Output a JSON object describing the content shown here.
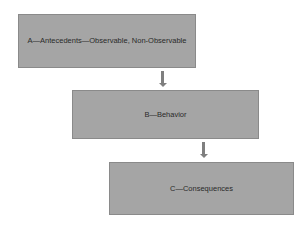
{
  "diagram": {
    "type": "flowchart",
    "nodes": [
      {
        "id": "A",
        "label": "A—Antecedents—Observable, Non-Observable"
      },
      {
        "id": "B",
        "label": "B—Behavior"
      },
      {
        "id": "C",
        "label": "C—Consequences"
      }
    ],
    "edges": [
      {
        "from": "A",
        "to": "B",
        "icon": "arrow-down-icon"
      },
      {
        "from": "B",
        "to": "C",
        "icon": "arrow-down-icon"
      }
    ],
    "colors": {
      "box_fill": "#a5a5a5",
      "box_border": "#8a8a8a",
      "arrow": "#7f7f7f",
      "text": "#2a2a2a",
      "background": "#ffffff"
    }
  }
}
